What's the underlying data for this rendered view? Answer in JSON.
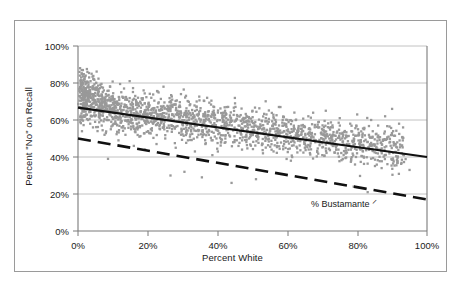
{
  "chart_data": {
    "type": "scatter",
    "title": "",
    "xlabel": "Percent White",
    "ylabel": "Percent \"No\" on Recall",
    "xlim": [
      0,
      100
    ],
    "ylim": [
      0,
      100
    ],
    "xticks": [
      "0%",
      "20%",
      "40%",
      "60%",
      "80%",
      "100%"
    ],
    "yticks": [
      "0%",
      "20%",
      "40%",
      "60%",
      "80%",
      "100%"
    ],
    "xtick_values": [
      0,
      20,
      40,
      60,
      80,
      100
    ],
    "ytick_values": [
      0,
      20,
      40,
      60,
      80,
      100
    ],
    "grid": "horizontal",
    "legend": "none",
    "point_color": "#999999",
    "point_marker": "square",
    "series": [
      {
        "name": "Percent \"No\" on Recall by Precinct",
        "type": "scatter",
        "marker_color": "#999999"
      },
      {
        "name": "Recall trend line",
        "type": "line",
        "style": "solid",
        "color": "#000000",
        "x": [
          0,
          100
        ],
        "y": [
          67,
          40
        ]
      },
      {
        "name": "% Bustamante",
        "type": "line",
        "style": "dashed",
        "color": "#000000",
        "x": [
          0,
          100
        ],
        "y": [
          49,
          16
        ]
      }
    ],
    "annotations": [
      {
        "text": "% Bustamante",
        "glyph": "arrow-hook",
        "x": 67,
        "y": 19
      }
    ],
    "points": [
      [
        0.4,
        86
      ],
      [
        0.5,
        84
      ],
      [
        0.6,
        88
      ],
      [
        0.7,
        81
      ],
      [
        0.8,
        79
      ],
      [
        0.9,
        83
      ],
      [
        1.0,
        76
      ],
      [
        1.1,
        85
      ],
      [
        1.2,
        72
      ],
      [
        1.3,
        80
      ],
      [
        1.4,
        87
      ],
      [
        1.5,
        69
      ],
      [
        1.6,
        78
      ],
      [
        1.7,
        74
      ],
      [
        1.8,
        82
      ],
      [
        1.9,
        66
      ],
      [
        2.0,
        77
      ],
      [
        2.1,
        71
      ],
      [
        2.2,
        84
      ],
      [
        2.3,
        63
      ],
      [
        2.4,
        80
      ],
      [
        2.5,
        75
      ],
      [
        2.6,
        68
      ],
      [
        2.7,
        86
      ],
      [
        2.8,
        73
      ],
      [
        2.9,
        60
      ],
      [
        3.0,
        79
      ],
      [
        3.1,
        70
      ],
      [
        3.2,
        83
      ],
      [
        3.3,
        65
      ],
      [
        3.4,
        76
      ],
      [
        3.5,
        58
      ],
      [
        3.6,
        81
      ],
      [
        3.7,
        72
      ],
      [
        3.8,
        67
      ],
      [
        3.9,
        85
      ],
      [
        4.0,
        62
      ],
      [
        4.1,
        74
      ],
      [
        4.2,
        78
      ],
      [
        4.3,
        56
      ],
      [
        4.4,
        69
      ],
      [
        4.5,
        82
      ],
      [
        4.6,
        71
      ],
      [
        4.7,
        64
      ],
      [
        4.8,
        77
      ],
      [
        4.9,
        59
      ],
      [
        5.0,
        73
      ],
      [
        5.2,
        80
      ],
      [
        5.4,
        66
      ],
      [
        5.6,
        54
      ],
      [
        5.8,
        75
      ],
      [
        6.0,
        70
      ],
      [
        6.2,
        61
      ],
      [
        6.4,
        79
      ],
      [
        6.6,
        68
      ],
      [
        6.8,
        57
      ],
      [
        7.0,
        72
      ],
      [
        7.2,
        64
      ],
      [
        7.4,
        76
      ],
      [
        7.6,
        52
      ],
      [
        7.8,
        69
      ],
      [
        8.0,
        74
      ],
      [
        8.2,
        60
      ],
      [
        8.4,
        66
      ],
      [
        8.6,
        39
      ],
      [
        8.8,
        71
      ],
      [
        9.0,
        63
      ],
      [
        9.2,
        78
      ],
      [
        9.4,
        55
      ],
      [
        9.6,
        68
      ],
      [
        10.0,
        72
      ],
      [
        10.4,
        58
      ],
      [
        10.8,
        65
      ],
      [
        11.2,
        70
      ],
      [
        11.6,
        49
      ],
      [
        12.0,
        62
      ],
      [
        12.4,
        75
      ],
      [
        12.8,
        56
      ],
      [
        13.2,
        67
      ],
      [
        13.6,
        52
      ],
      [
        14.0,
        71
      ],
      [
        14.4,
        60
      ],
      [
        14.8,
        81
      ],
      [
        15.2,
        55
      ],
      [
        15.6,
        66
      ],
      [
        16.0,
        46
      ],
      [
        16.4,
        73
      ],
      [
        16.8,
        58
      ],
      [
        17.2,
        63
      ],
      [
        17.6,
        51
      ],
      [
        18.0,
        69
      ],
      [
        18.4,
        57
      ],
      [
        18.8,
        76
      ],
      [
        19.2,
        44
      ],
      [
        19.6,
        61
      ],
      [
        20.0,
        66
      ],
      [
        20.5,
        53
      ],
      [
        21.0,
        72
      ],
      [
        21.5,
        58
      ],
      [
        22.0,
        64
      ],
      [
        22.5,
        47
      ],
      [
        23.0,
        69
      ],
      [
        23.5,
        55
      ],
      [
        24.0,
        62
      ],
      [
        24.5,
        78
      ],
      [
        25.0,
        50
      ],
      [
        25.5,
        66
      ],
      [
        26.0,
        57
      ],
      [
        26.5,
        30
      ],
      [
        27.0,
        71
      ],
      [
        27.5,
        60
      ],
      [
        28.0,
        45
      ],
      [
        28.5,
        65
      ],
      [
        29.0,
        53
      ],
      [
        29.5,
        74
      ],
      [
        30.0,
        58
      ],
      [
        30.5,
        32
      ],
      [
        31.0,
        63
      ],
      [
        31.5,
        49
      ],
      [
        32.0,
        68
      ],
      [
        32.5,
        56
      ],
      [
        33.0,
        61
      ],
      [
        33.5,
        43
      ],
      [
        34.0,
        70
      ],
      [
        34.5,
        54
      ],
      [
        35.0,
        65
      ],
      [
        35.5,
        29
      ],
      [
        36.0,
        59
      ],
      [
        36.5,
        47
      ],
      [
        37.0,
        72
      ],
      [
        37.5,
        52
      ],
      [
        38.0,
        62
      ],
      [
        38.5,
        41
      ],
      [
        39.0,
        67
      ],
      [
        39.5,
        55
      ],
      [
        40.0,
        60
      ],
      [
        41.0,
        48
      ],
      [
        42.0,
        64
      ],
      [
        43.0,
        53
      ],
      [
        44.0,
        26
      ],
      [
        45.0,
        69
      ],
      [
        46.0,
        57
      ],
      [
        47.0,
        44
      ],
      [
        48.0,
        61
      ],
      [
        49.0,
        50
      ],
      [
        50.0,
        65
      ],
      [
        51.0,
        28
      ],
      [
        52.0,
        56
      ],
      [
        53.0,
        42
      ],
      [
        54.0,
        63
      ],
      [
        55.0,
        52
      ],
      [
        56.0,
        58
      ],
      [
        57.0,
        46
      ],
      [
        58.0,
        67
      ],
      [
        59.0,
        54
      ],
      [
        60.0,
        60
      ],
      [
        61.0,
        38
      ],
      [
        62.0,
        64
      ],
      [
        63.0,
        51
      ],
      [
        64.0,
        57
      ],
      [
        65.0,
        45
      ],
      [
        66.0,
        62
      ],
      [
        67.0,
        53
      ],
      [
        68.0,
        48
      ],
      [
        69.0,
        59
      ],
      [
        70.0,
        41
      ],
      [
        71.0,
        65
      ],
      [
        72.0,
        50
      ],
      [
        73.0,
        56
      ],
      [
        74.0,
        44
      ],
      [
        75.0,
        61
      ],
      [
        76.0,
        52
      ],
      [
        77.0,
        47
      ],
      [
        78.0,
        58
      ],
      [
        79.0,
        24
      ],
      [
        80.0,
        63
      ],
      [
        81.0,
        49
      ],
      [
        82.0,
        55
      ],
      [
        83.0,
        21
      ],
      [
        84.0,
        60
      ],
      [
        85.0,
        46
      ],
      [
        86.0,
        57
      ],
      [
        87.0,
        34
      ],
      [
        88.0,
        62
      ],
      [
        89.0,
        51
      ],
      [
        90.0,
        66
      ],
      [
        91.0,
        47
      ],
      [
        92.0,
        58
      ],
      [
        95.0,
        33
      ]
    ]
  },
  "axes": {
    "x_title": "Percent White",
    "y_title": "Percent \"No\" on Recall"
  },
  "annotation": {
    "label": "% Bustamante",
    "glyph": "⸌"
  }
}
